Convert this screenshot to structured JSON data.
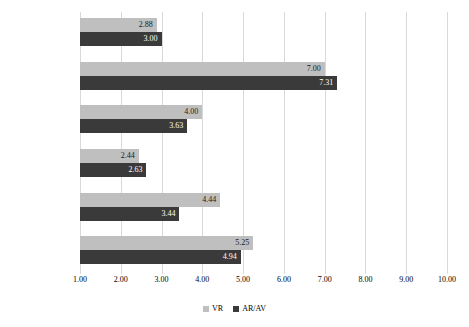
{
  "chart_data": {
    "type": "bar",
    "orientation": "horizontal",
    "title": "",
    "xlabel": "",
    "ylabel": "",
    "xlim": [
      1.0,
      10.0
    ],
    "grid": true,
    "legend_position": "bottom",
    "categories": [
      "Mental Demand",
      "Physical Demand",
      "Temporal Demand",
      "Effort",
      "Performance",
      "Frustration"
    ],
    "category_order_top_to_bottom": [
      "Frustration",
      "Performance",
      "Effort",
      "Temporal Demand",
      "Physical Demand",
      "Mental Demand"
    ],
    "xticks": [
      "1.00",
      "2.00",
      "3.00",
      "4.00",
      "5.00",
      "6.00",
      "7.00",
      "8.00",
      "9.00",
      "10.00"
    ],
    "xtick_values": [
      1,
      2,
      3,
      4,
      5,
      6,
      7,
      8,
      9,
      10
    ],
    "series": [
      {
        "name": "VR",
        "color": "#bfbfbf",
        "values": [
          5.25,
          4.44,
          2.44,
          4.0,
          7.0,
          2.88
        ],
        "labels": [
          "5.25",
          "4.44",
          "2.44",
          "4.00",
          "7.00",
          "2.88"
        ]
      },
      {
        "name": "AR/AV",
        "color": "#3a3a3a",
        "values": [
          4.94,
          3.44,
          2.63,
          3.63,
          7.31,
          3.0
        ],
        "labels": [
          "4.94",
          "3.44",
          "2.63",
          "3.63",
          "7.31",
          "3.00"
        ]
      }
    ],
    "groups_top_to_bottom": [
      {
        "category": "Frustration",
        "vr_value": 2.88,
        "vr_label": "2.88",
        "ar_value": 3.0,
        "ar_label": "3.00"
      },
      {
        "category": "Performance",
        "vr_value": 7.0,
        "vr_label": "7.00",
        "ar_value": 7.31,
        "ar_label": "7.31"
      },
      {
        "category": "Effort",
        "vr_value": 4.0,
        "vr_label": "4.00",
        "ar_value": 3.63,
        "ar_label": "3.63"
      },
      {
        "category": "Temporal Demand",
        "vr_value": 2.44,
        "vr_label": "2.44",
        "ar_value": 2.63,
        "ar_label": "2.63"
      },
      {
        "category": "Physical Demand",
        "vr_value": 4.44,
        "vr_label": "4.44",
        "ar_value": 3.44,
        "ar_label": "3.44"
      },
      {
        "category": "Mental Demand",
        "vr_value": 5.25,
        "vr_label": "5.25",
        "ar_value": 4.94,
        "ar_label": "4.94"
      }
    ]
  },
  "legend": {
    "items": [
      {
        "label": "VR",
        "color": "#bfbfbf"
      },
      {
        "label": "AR/AV",
        "color": "#3a3a3a"
      }
    ]
  },
  "colors": {
    "vr": "#bfbfbf",
    "ar": "#3a3a3a",
    "gridline": "#d9d9d9",
    "background": "#ffffff",
    "text": "#000000",
    "label_on_dark": "#ffffff"
  }
}
